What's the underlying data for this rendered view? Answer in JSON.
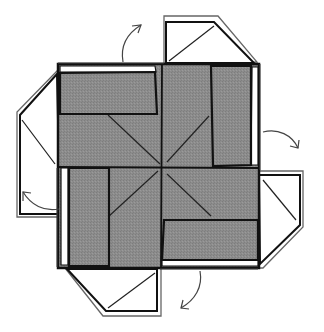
{
  "diagram": {
    "colors": {
      "paper_shade": "#8a8a8a",
      "line": "#1a1a1a",
      "outline": "#555555",
      "background": "#ffffff"
    },
    "flaps": [
      {
        "name": "top-flap",
        "direction": "up-left"
      },
      {
        "name": "right-flap",
        "direction": "right-down"
      },
      {
        "name": "bottom-flap",
        "direction": "down-left"
      },
      {
        "name": "left-flap",
        "direction": "left-up"
      }
    ],
    "arrows": [
      {
        "name": "top-unfold-arrow"
      },
      {
        "name": "right-unfold-arrow"
      },
      {
        "name": "bottom-unfold-arrow"
      },
      {
        "name": "left-unfold-arrow"
      }
    ]
  }
}
